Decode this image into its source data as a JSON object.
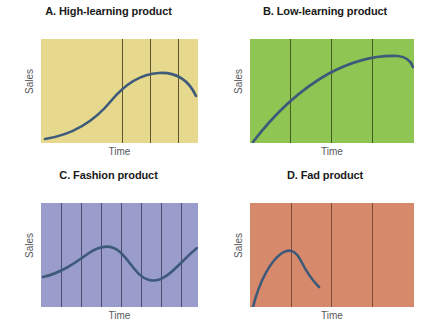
{
  "figure": {
    "background_color": "#ffffff",
    "curve_color": "#3d5a7a",
    "label_color": "#58585a",
    "title_color": "#1a1a1a"
  },
  "panels": [
    {
      "id": "panel-a",
      "title": "A. High-learning product",
      "ylabel": "Sales",
      "xlabel": "Time",
      "fill_color": "#e6d98d",
      "gridline_color": "#4a3b22",
      "gridlines_x": [
        81,
        109,
        137
      ],
      "curve_path": "M 4 100 C 30 96 52 84 70 62 C 84 45 100 35 118 34 C 136 33 148 42 155 57"
    },
    {
      "id": "panel-b",
      "title": "B. Low-learning product",
      "ylabel": "Sales",
      "xlabel": "Time",
      "fill_color": "#8fc653",
      "gridline_color": "#2f4414",
      "gridlines_x": [
        40,
        81,
        122
      ],
      "curve_path": "M 3 103 C 22 78 48 52 78 35 C 104 21 128 16 148 17 C 157 18 161 22 163 28"
    },
    {
      "id": "panel-c",
      "title": "C. Fashion product",
      "ylabel": "Sales",
      "xlabel": "Time",
      "fill_color": "#9a9ccb",
      "gridline_color": "#3b3a58",
      "gridlines_x": [
        20,
        40,
        60,
        80,
        100,
        120,
        140
      ],
      "curve_path": "M 2 74 C 20 70 34 60 48 50 C 60 42 70 41 79 49 C 90 59 96 74 108 77 C 120 80 130 70 142 58 C 148 52 152 48 156 45"
    },
    {
      "id": "panel-d",
      "title": "D. Fad product",
      "ylabel": "Sales",
      "xlabel": "Time",
      "fill_color": "#d78a6b",
      "gridline_color": "#5c3524",
      "gridlines_x": [
        41,
        81,
        122
      ],
      "curve_path": "M 3 104 C 9 80 20 58 32 50 C 40 45 46 48 51 58 C 57 70 63 78 69 84"
    }
  ],
  "chart_data": {
    "type": "line",
    "xlabel": "Time",
    "ylabel": "Sales",
    "grid": true,
    "legend_position": "none",
    "panels": [
      {
        "label": "A. High-learning product",
        "fill_color": "#e6d98d",
        "x": [
          0,
          0.15,
          0.3,
          0.45,
          0.6,
          0.75,
          0.85,
          1.0
        ],
        "y": [
          0.03,
          0.07,
          0.18,
          0.38,
          0.58,
          0.68,
          0.68,
          0.55
        ],
        "description": "Slow initial sales growth, then steady rise to a late peak followed by gentle decline"
      },
      {
        "label": "B. Low-learning product",
        "fill_color": "#8fc653",
        "x": [
          0,
          0.15,
          0.3,
          0.45,
          0.6,
          0.75,
          0.9,
          1.0
        ],
        "y": [
          0.01,
          0.26,
          0.48,
          0.64,
          0.78,
          0.85,
          0.84,
          0.78
        ],
        "description": "Rapid early sales growth that flattens into a long plateau"
      },
      {
        "label": "C. Fashion product",
        "fill_color": "#9a9ccb",
        "x": [
          0,
          0.13,
          0.25,
          0.38,
          0.5,
          0.62,
          0.75,
          0.88,
          1.0
        ],
        "y": [
          0.29,
          0.35,
          0.47,
          0.56,
          0.52,
          0.31,
          0.26,
          0.38,
          0.57
        ],
        "description": "Sales rise to a peak, recede to a trough, then rise again in a recurring cycle"
      },
      {
        "label": "D. Fad product",
        "fill_color": "#d78a6b",
        "x": [
          0,
          0.08,
          0.17,
          0.25,
          0.33,
          0.42
        ],
        "y": [
          0.0,
          0.32,
          0.5,
          0.53,
          0.38,
          0.19
        ],
        "description": "Very rapid rise to an early peak followed by an equally rapid collapse"
      }
    ]
  }
}
